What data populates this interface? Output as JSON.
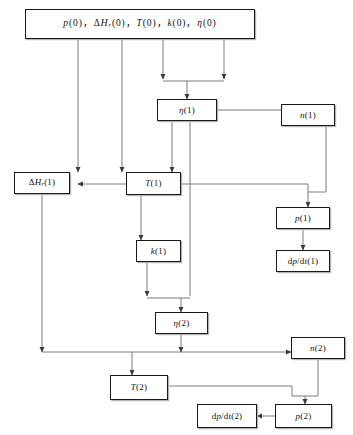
{
  "diagram": {
    "type": "flowchart",
    "line_color": "#555555",
    "box_border_color": "#1a1a1a",
    "background": "#ffffff",
    "nodes": [
      {
        "id": "init",
        "label": "p(0)，ΔHᵣ(0)，T(0)，k(0)，η(0)",
        "x": 25,
        "y": 9,
        "w": 230,
        "h": 30
      },
      {
        "id": "eta1",
        "label": "η(1)",
        "x": 157,
        "y": 99,
        "w": 60,
        "h": 22
      },
      {
        "id": "n1",
        "label": "n(1)",
        "x": 281,
        "y": 104,
        "w": 54,
        "h": 22
      },
      {
        "id": "dhr1",
        "label": "ΔHᵣ(1)",
        "x": 14,
        "y": 172,
        "w": 56,
        "h": 22
      },
      {
        "id": "T1",
        "label": "T(1)",
        "x": 126,
        "y": 172,
        "w": 55,
        "h": 23
      },
      {
        "id": "p1",
        "label": "p(1)",
        "x": 276,
        "y": 207,
        "w": 54,
        "h": 22
      },
      {
        "id": "k1",
        "label": "k(1)",
        "x": 136,
        "y": 240,
        "w": 45,
        "h": 22
      },
      {
        "id": "dpdt1",
        "label": "dp/dt(1)",
        "x": 276,
        "y": 250,
        "w": 54,
        "h": 22
      },
      {
        "id": "eta2",
        "label": "η(2)",
        "x": 155,
        "y": 312,
        "w": 53,
        "h": 22
      },
      {
        "id": "n2",
        "label": "n(2)",
        "x": 291,
        "y": 337,
        "w": 54,
        "h": 22
      },
      {
        "id": "T2",
        "label": "T(2)",
        "x": 110,
        "y": 375,
        "w": 58,
        "h": 25
      },
      {
        "id": "dpdt2",
        "label": "dp/dt(2)",
        "x": 197,
        "y": 404,
        "w": 60,
        "h": 24
      },
      {
        "id": "p2",
        "label": "p(2)",
        "x": 275,
        "y": 404,
        "w": 57,
        "h": 24
      }
    ]
  }
}
